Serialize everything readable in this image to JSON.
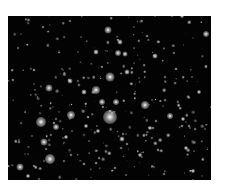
{
  "image": {
    "subject": "star cluster",
    "frame": {
      "x": 8,
      "y": 16,
      "width": 203,
      "height": 164
    },
    "background_color": "#030303",
    "page_background": "#ffffff",
    "bright_stars": [
      {
        "x": 110,
        "y": 117,
        "r": 7
      },
      {
        "x": 41,
        "y": 122,
        "r": 5
      },
      {
        "x": 50,
        "y": 159,
        "r": 5
      },
      {
        "x": 110,
        "y": 77,
        "r": 4.5
      },
      {
        "x": 71,
        "y": 115,
        "r": 4
      },
      {
        "x": 145,
        "y": 105,
        "r": 4
      },
      {
        "x": 96,
        "y": 90,
        "r": 4
      },
      {
        "x": 49,
        "y": 88,
        "r": 3.5
      },
      {
        "x": 108,
        "y": 30,
        "r": 3.5
      },
      {
        "x": 20,
        "y": 167,
        "r": 3.5
      },
      {
        "x": 44,
        "y": 142,
        "r": 3.5
      },
      {
        "x": 56,
        "y": 127,
        "r": 3
      },
      {
        "x": 170,
        "y": 116,
        "r": 3
      },
      {
        "x": 206,
        "y": 34,
        "r": 3
      },
      {
        "x": 102,
        "y": 102,
        "r": 3
      },
      {
        "x": 116,
        "y": 102,
        "r": 3
      },
      {
        "x": 118,
        "y": 53,
        "r": 3
      },
      {
        "x": 125,
        "y": 54,
        "r": 2.5
      },
      {
        "x": 120,
        "y": 42,
        "r": 2.5
      },
      {
        "x": 70,
        "y": 81,
        "r": 2.5
      },
      {
        "x": 84,
        "y": 92,
        "r": 2.5
      },
      {
        "x": 122,
        "y": 139,
        "r": 2.5
      },
      {
        "x": 155,
        "y": 56,
        "r": 2.5
      },
      {
        "x": 96,
        "y": 52,
        "r": 2.5
      },
      {
        "x": 28,
        "y": 176,
        "r": 2
      },
      {
        "x": 183,
        "y": 119,
        "r": 2
      },
      {
        "x": 199,
        "y": 92,
        "r": 2
      },
      {
        "x": 182,
        "y": 16,
        "r": 2
      },
      {
        "x": 127,
        "y": 72,
        "r": 2.5
      },
      {
        "x": 66,
        "y": 137,
        "r": 2
      },
      {
        "x": 98,
        "y": 131,
        "r": 2
      },
      {
        "x": 150,
        "y": 128,
        "r": 2
      },
      {
        "x": 86,
        "y": 126,
        "r": 2
      },
      {
        "x": 186,
        "y": 148,
        "r": 2
      },
      {
        "x": 140,
        "y": 155,
        "r": 2
      },
      {
        "x": 193,
        "y": 171,
        "r": 2
      }
    ],
    "faint_star_count": 320,
    "faint_star_seed": 7
  }
}
